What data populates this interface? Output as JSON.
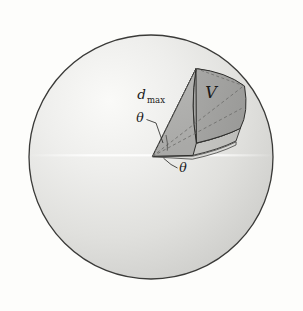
{
  "figure": {
    "background_color": "#fdfdfb",
    "labels": {
      "d_max_base": "d",
      "d_max_sub": "max",
      "theta_upper": "θ",
      "theta_lower": "θ",
      "volume": "V"
    },
    "colors": {
      "sphere_fill_light": "#f2f2f0",
      "sphere_fill_mid": "#dcdcda",
      "sphere_fill_dark": "#c9c9c6",
      "sphere_outline": "#3a3a38",
      "wedge_face_front": "#b0b0ae",
      "wedge_face_cap": "#a3a3a1",
      "wedge_face_top": "#9e9e9c",
      "wedge_face_bottom": "#c4c4c1",
      "wedge_outline": "#2e2e2c",
      "dashed_line": "#6e6e6c",
      "leader_line": "#2e2e2c",
      "highlight_line": "#fbfbf9"
    },
    "geometry": {
      "sphere_center_x": 151,
      "sphere_center_y": 157,
      "sphere_radius": 122,
      "apex_x": 152,
      "apex_y": 156
    },
    "icon_names": {
      "sphere": "sphere-outline-icon",
      "wedge": "spherical-sector-icon",
      "dashed": "dashed-radius-icon"
    }
  }
}
